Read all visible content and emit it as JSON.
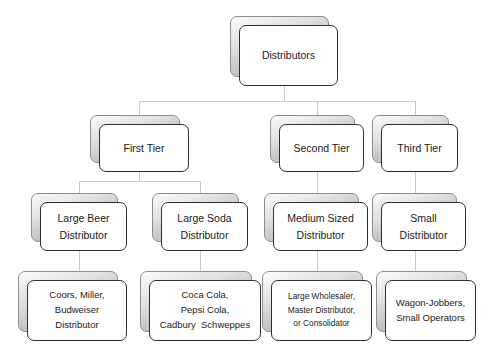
{
  "diagram": {
    "background_color": "#ffffff",
    "connector_color": "#c9c9c9",
    "card_border_color": "#2f2f2f",
    "card_fill_color": "#ffffff",
    "card_shadow_color": "#c2c2c2"
  },
  "nodes": {
    "root": {
      "lines": [
        "Distributors"
      ]
    },
    "tier1": {
      "lines": [
        "First Tier"
      ]
    },
    "tier2": {
      "lines": [
        "Second Tier"
      ]
    },
    "tier3": {
      "lines": [
        "Third Tier"
      ]
    },
    "large_beer": {
      "lines": [
        "Large Beer",
        "Distributor"
      ]
    },
    "large_soda": {
      "lines": [
        "Large Soda",
        "Distributor"
      ]
    },
    "medium_sized": {
      "lines": [
        "Medium Sized",
        "Distributor"
      ]
    },
    "small": {
      "lines": [
        "Small",
        "Distributor"
      ]
    },
    "beer_brands": {
      "lines": [
        "Coors, Miller,",
        "Budweiser",
        "Distributor"
      ]
    },
    "soda_brands": {
      "lines": [
        "Coca Cola,",
        "Pepsi Cola,",
        "Cadbury  Schweppes"
      ]
    },
    "wholesalers": {
      "lines": [
        "Large Wholesaler,",
        "Master Distributor,",
        "or Consolidator"
      ]
    },
    "jobbers": {
      "lines": [
        "Wagon-Jobbers,",
        "Small Operators"
      ]
    }
  }
}
